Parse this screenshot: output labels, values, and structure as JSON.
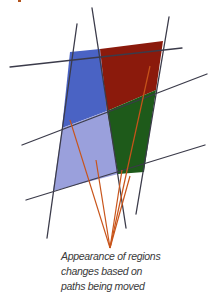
{
  "diagram": {
    "title_cut_off": true,
    "colors": {
      "blue_region": "#4a63c4",
      "red_region": "#8b1a0c",
      "lavender_region": "#9aa0dc",
      "green_region": "#1e5a1a",
      "path_line": "#3b3b4a",
      "pointer_line": "#c8541a",
      "caption_text": "#3a3a3a"
    },
    "regions": [
      {
        "name": "blue",
        "points": "70,52 100,49 107,111 62,128"
      },
      {
        "name": "red",
        "points": "100,49 163,41 156,90 107,111"
      },
      {
        "name": "lavender",
        "points": "62,128 107,111 118,174 53,191"
      },
      {
        "name": "green",
        "points": "107,111 156,90 144,172 118,174"
      }
    ],
    "paths": [
      {
        "name": "path-vertical-left",
        "x1": 77,
        "y1": 24,
        "x2": 47,
        "y2": 238
      },
      {
        "name": "path-vertical-middle",
        "x1": 92,
        "y1": 8,
        "x2": 126,
        "y2": 228
      },
      {
        "name": "path-vertical-right",
        "x1": 169,
        "y1": 17,
        "x2": 136,
        "y2": 214
      },
      {
        "name": "path-horizontal-top",
        "x1": 10,
        "y1": 67,
        "x2": 182,
        "y2": 48
      },
      {
        "name": "path-horizontal-middle",
        "x1": 22,
        "y1": 145,
        "x2": 207,
        "y2": 74
      },
      {
        "name": "path-horizontal-bottom",
        "x1": 26,
        "y1": 200,
        "x2": 205,
        "y2": 145
      }
    ],
    "pointers": [
      {
        "name": "pointer-to-blue",
        "x1": 70,
        "y1": 120,
        "x2": 110,
        "y2": 248
      },
      {
        "name": "pointer-to-lavender",
        "x1": 96,
        "y1": 160,
        "x2": 110,
        "y2": 248
      },
      {
        "name": "pointer-to-green-left",
        "x1": 122,
        "y1": 170,
        "x2": 110,
        "y2": 248
      },
      {
        "name": "pointer-to-green-right",
        "x1": 130,
        "y1": 176,
        "x2": 110,
        "y2": 248
      },
      {
        "name": "pointer-to-red",
        "x1": 150,
        "y1": 66,
        "x2": 110,
        "y2": 248
      }
    ]
  },
  "caption": {
    "line1": "Appearance of regions",
    "line2": "changes based on",
    "line3": "paths being moved"
  }
}
